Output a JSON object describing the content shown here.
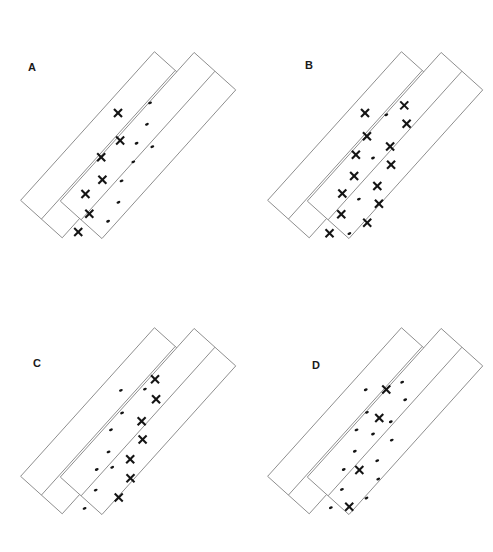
{
  "figure": {
    "type": "diagram",
    "width": 493,
    "height": 552,
    "background_color": "#ffffff",
    "stroke_color": "#8a8a8a",
    "marker_color": "#141414",
    "rotation_degrees": -48,
    "caption": ""
  },
  "panels": [
    {
      "id": "A",
      "label": "A",
      "label_x": 28,
      "label_y": 62,
      "origin_x": 0,
      "origin_y": 0,
      "x_count": 7,
      "dot_count": 8,
      "boxes": [
        {
          "name": "upper-rectangle",
          "x": -10,
          "y": 0,
          "w": 200,
          "h": 56,
          "divider_offset": 28
        },
        {
          "name": "lower-rectangle",
          "x": 16,
          "y": 30,
          "w": 200,
          "h": 56,
          "divider_offset": 28
        }
      ],
      "markers": [
        {
          "type": "x",
          "x": 120,
          "y": 14
        },
        {
          "type": "x",
          "x": 101,
          "y": 34
        },
        {
          "type": "x",
          "x": 76,
          "y": 31
        },
        {
          "type": "x",
          "x": 60,
          "y": 47
        },
        {
          "type": "x",
          "x": 38,
          "y": 44
        },
        {
          "type": "x",
          "x": 26,
          "y": 60
        },
        {
          "type": "x",
          "x": 5,
          "y": 64
        },
        {
          "type": "dot",
          "x": 149,
          "y": 31
        },
        {
          "type": "dot",
          "x": 131,
          "y": 43
        },
        {
          "type": "dot",
          "x": 110,
          "y": 48
        },
        {
          "type": "dot",
          "x": 94,
          "y": 58
        },
        {
          "type": "dot",
          "x": 72,
          "y": 62
        },
        {
          "type": "dot",
          "x": 54,
          "y": 74
        },
        {
          "type": "dot",
          "x": 33,
          "y": 79
        },
        {
          "type": "dot",
          "x": 118,
          "y": 62
        }
      ]
    },
    {
      "id": "B",
      "label": "B",
      "label_x": 305,
      "label_y": 60,
      "origin_x": 247,
      "origin_y": 0,
      "x_count": 14,
      "dot_count": 4,
      "boxes": [
        {
          "name": "upper-rectangle",
          "x": -10,
          "y": 0,
          "w": 200,
          "h": 56,
          "divider_offset": 28
        },
        {
          "name": "lower-rectangle",
          "x": 16,
          "y": 30,
          "w": 200,
          "h": 56,
          "divider_offset": 28
        }
      ],
      "markers": [
        {
          "type": "x",
          "x": 120,
          "y": 14
        },
        {
          "type": "x",
          "x": 104,
          "y": 31
        },
        {
          "type": "x",
          "x": 83,
          "y": 35
        },
        {
          "type": "x",
          "x": 66,
          "y": 48
        },
        {
          "type": "x",
          "x": 45,
          "y": 51
        },
        {
          "type": "x",
          "x": 29,
          "y": 64
        },
        {
          "type": "x",
          "x": 7,
          "y": 68
        },
        {
          "type": "x",
          "x": 152,
          "y": 38
        },
        {
          "type": "x",
          "x": 140,
          "y": 52
        },
        {
          "type": "x",
          "x": 112,
          "y": 55
        },
        {
          "type": "x",
          "x": 99,
          "y": 68
        },
        {
          "type": "x",
          "x": 74,
          "y": 72
        },
        {
          "type": "x",
          "x": 62,
          "y": 85
        },
        {
          "type": "x",
          "x": 40,
          "y": 89
        },
        {
          "type": "dot",
          "x": 133,
          "y": 31
        },
        {
          "type": "dot",
          "x": 92,
          "y": 50
        },
        {
          "type": "dot",
          "x": 52,
          "y": 67
        },
        {
          "type": "dot",
          "x": 20,
          "y": 83
        }
      ]
    },
    {
      "id": "C",
      "label": "C",
      "label_x": 33,
      "label_y": 358,
      "origin_x": 0,
      "origin_y": 276,
      "x_count": 7,
      "dot_count": 9,
      "boxes": [
        {
          "name": "upper-rectangle",
          "x": -10,
          "y": 0,
          "w": 200,
          "h": 56,
          "divider_offset": 28
        },
        {
          "name": "lower-rectangle",
          "x": 16,
          "y": 30,
          "w": 200,
          "h": 56,
          "divider_offset": 28
        }
      ],
      "markers": [
        {
          "type": "dot",
          "x": 121,
          "y": 17
        },
        {
          "type": "dot",
          "x": 105,
          "y": 33
        },
        {
          "type": "dot",
          "x": 85,
          "y": 36
        },
        {
          "type": "dot",
          "x": 67,
          "y": 49
        },
        {
          "type": "dot",
          "x": 46,
          "y": 52
        },
        {
          "type": "dot",
          "x": 30,
          "y": 65
        },
        {
          "type": "dot",
          "x": 9,
          "y": 69
        },
        {
          "type": "dot",
          "x": 138,
          "y": 34
        },
        {
          "type": "dot",
          "x": 58,
          "y": 62
        },
        {
          "type": "x",
          "x": 152,
          "y": 35
        },
        {
          "type": "x",
          "x": 138,
          "y": 49
        },
        {
          "type": "x",
          "x": 112,
          "y": 53
        },
        {
          "type": "x",
          "x": 99,
          "y": 66
        },
        {
          "type": "x",
          "x": 76,
          "y": 70
        },
        {
          "type": "x",
          "x": 62,
          "y": 83
        },
        {
          "type": "x",
          "x": 40,
          "y": 87
        }
      ]
    },
    {
      "id": "D",
      "label": "D",
      "label_x": 312,
      "label_y": 360,
      "origin_x": 247,
      "origin_y": 276,
      "x_count": 4,
      "dot_count": 15,
      "boxes": [
        {
          "name": "upper-rectangle",
          "x": -10,
          "y": 0,
          "w": 200,
          "h": 56,
          "divider_offset": 28
        },
        {
          "name": "lower-rectangle",
          "x": 16,
          "y": 30,
          "w": 200,
          "h": 56,
          "divider_offset": 28
        }
      ],
      "markers": [
        {
          "type": "dot",
          "x": 120,
          "y": 15
        },
        {
          "type": "dot",
          "x": 104,
          "y": 31
        },
        {
          "type": "dot",
          "x": 84,
          "y": 35
        },
        {
          "type": "dot",
          "x": 67,
          "y": 48
        },
        {
          "type": "dot",
          "x": 46,
          "y": 52
        },
        {
          "type": "dot",
          "x": 30,
          "y": 64
        },
        {
          "type": "dot",
          "x": 9,
          "y": 68
        },
        {
          "type": "dot",
          "x": 150,
          "y": 37
        },
        {
          "type": "dot",
          "x": 139,
          "y": 51
        },
        {
          "type": "dot",
          "x": 113,
          "y": 55
        },
        {
          "type": "dot",
          "x": 100,
          "y": 68
        },
        {
          "type": "dot",
          "x": 75,
          "y": 71
        },
        {
          "type": "dot",
          "x": 62,
          "y": 84
        },
        {
          "type": "dot",
          "x": 40,
          "y": 88
        },
        {
          "type": "dot",
          "x": 92,
          "y": 50
        },
        {
          "type": "x",
          "x": 134,
          "y": 30
        },
        {
          "type": "x",
          "x": 108,
          "y": 44
        },
        {
          "type": "x",
          "x": 56,
          "y": 64
        },
        {
          "type": "x",
          "x": 22,
          "y": 81
        }
      ]
    }
  ]
}
